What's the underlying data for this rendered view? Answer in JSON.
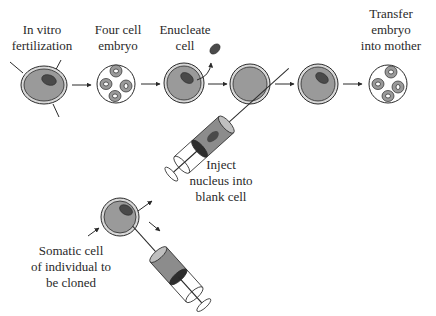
{
  "diagram": {
    "labels": {
      "ivf": [
        "In vitro",
        "fertilization"
      ],
      "four_cell": [
        "Four cell",
        "embryo"
      ],
      "enucleate": [
        "Enucleate",
        "cell"
      ],
      "transfer": [
        "Transfer",
        "embryo",
        "into mother"
      ],
      "inject": [
        "Inject",
        "nucleus into",
        "blank cell"
      ],
      "somatic": [
        "Somatic cell",
        "of individual to",
        "be cloned"
      ]
    },
    "colors": {
      "cell_fill": "#9a9a9a",
      "cell_ring": "#d8d8d8",
      "nucleus": "#4a4a4a",
      "outline": "#2a2a2a",
      "syringe_body": "#8c8c8c",
      "background": "#ffffff"
    },
    "steps": [
      {
        "id": "ivf",
        "shape": "egg-with-nucleus-and-sperm"
      },
      {
        "id": "four_cell",
        "shape": "four-cell-embryo"
      },
      {
        "id": "enucleate",
        "shape": "egg-nucleus-removed"
      },
      {
        "id": "blank",
        "shape": "blank-egg"
      },
      {
        "id": "reconstructed",
        "shape": "egg-with-new-nucleus"
      },
      {
        "id": "transfer",
        "shape": "four-cell-embryo"
      }
    ]
  }
}
